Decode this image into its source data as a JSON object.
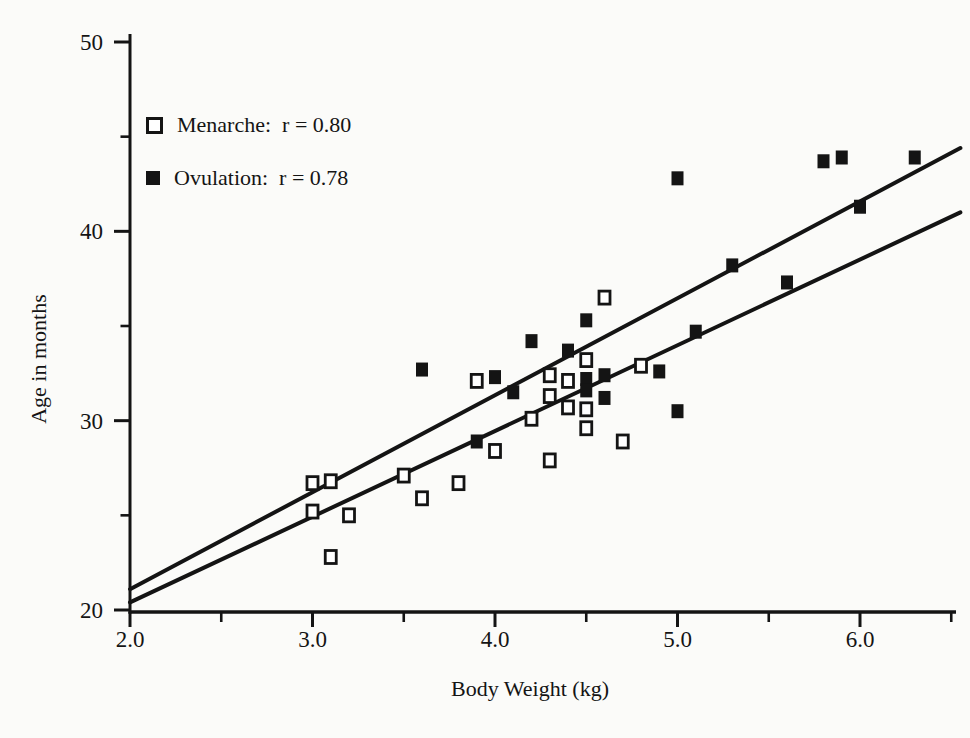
{
  "figure": {
    "background": "#fbfbf9",
    "ink": "#141414"
  },
  "legend": {
    "items": [
      {
        "name": "Menarche",
        "marker": "open-square",
        "label": "Menarche:  r = 0.80"
      },
      {
        "name": "Ovulation",
        "marker": "filled-square",
        "label": "Ovulation:  r = 0.78"
      }
    ]
  },
  "chart_data": {
    "type": "scatter",
    "title": "",
    "xlabel": "Body Weight (kg)",
    "ylabel": "Age in months",
    "xlim": [
      2.0,
      6.55
    ],
    "ylim": [
      20,
      50
    ],
    "grid": false,
    "legend_position": "upper-left-inside",
    "x_major_ticks": [
      2.0,
      3.0,
      4.0,
      5.0,
      6.0
    ],
    "x_tick_labels": [
      "2.0",
      "3.0",
      "4.0",
      "5.0",
      "6.0"
    ],
    "x_minor_ticks": [
      2.5,
      3.5,
      4.5,
      5.5,
      6.5
    ],
    "y_major_ticks": [
      20,
      30,
      40,
      50
    ],
    "y_tick_labels": [
      "20",
      "30",
      "40",
      "50"
    ],
    "y_minor_ticks": [
      25,
      35,
      45
    ],
    "series": [
      {
        "name": "Menarche",
        "r": 0.8,
        "marker": "open-square",
        "points": [
          [
            3.0,
            26.7
          ],
          [
            3.1,
            26.8
          ],
          [
            3.0,
            25.2
          ],
          [
            3.2,
            25.0
          ],
          [
            3.1,
            22.8
          ],
          [
            3.5,
            27.1
          ],
          [
            3.6,
            25.9
          ],
          [
            3.8,
            26.7
          ],
          [
            3.9,
            32.1
          ],
          [
            4.0,
            28.4
          ],
          [
            4.2,
            30.1
          ],
          [
            4.3,
            32.4
          ],
          [
            4.3,
            31.3
          ],
          [
            4.3,
            27.9
          ],
          [
            4.4,
            32.1
          ],
          [
            4.4,
            30.7
          ],
          [
            4.5,
            33.2
          ],
          [
            4.5,
            30.6
          ],
          [
            4.5,
            29.6
          ],
          [
            4.6,
            36.5
          ],
          [
            4.7,
            28.9
          ],
          [
            4.8,
            32.9
          ]
        ]
      },
      {
        "name": "Ovulation",
        "r": 0.78,
        "marker": "filled-square",
        "points": [
          [
            3.6,
            32.7
          ],
          [
            3.9,
            28.9
          ],
          [
            4.0,
            32.3
          ],
          [
            4.1,
            31.5
          ],
          [
            4.2,
            34.2
          ],
          [
            4.4,
            33.7
          ],
          [
            4.5,
            35.3
          ],
          [
            4.5,
            32.2
          ],
          [
            4.5,
            31.6
          ],
          [
            4.6,
            32.4
          ],
          [
            4.6,
            31.2
          ],
          [
            4.9,
            32.6
          ],
          [
            5.0,
            42.8
          ],
          [
            5.0,
            30.5
          ],
          [
            5.1,
            34.7
          ],
          [
            5.3,
            38.2
          ],
          [
            5.6,
            37.3
          ],
          [
            5.8,
            43.7
          ],
          [
            5.9,
            43.9
          ],
          [
            6.0,
            41.3
          ],
          [
            6.3,
            43.9
          ]
        ]
      }
    ],
    "regression_lines": [
      {
        "series": "Menarche",
        "x1": 2.0,
        "y1": 20.4,
        "x2": 6.55,
        "y2": 41.0
      },
      {
        "series": "Ovulation",
        "x1": 2.0,
        "y1": 21.1,
        "x2": 6.55,
        "y2": 44.4
      }
    ]
  }
}
